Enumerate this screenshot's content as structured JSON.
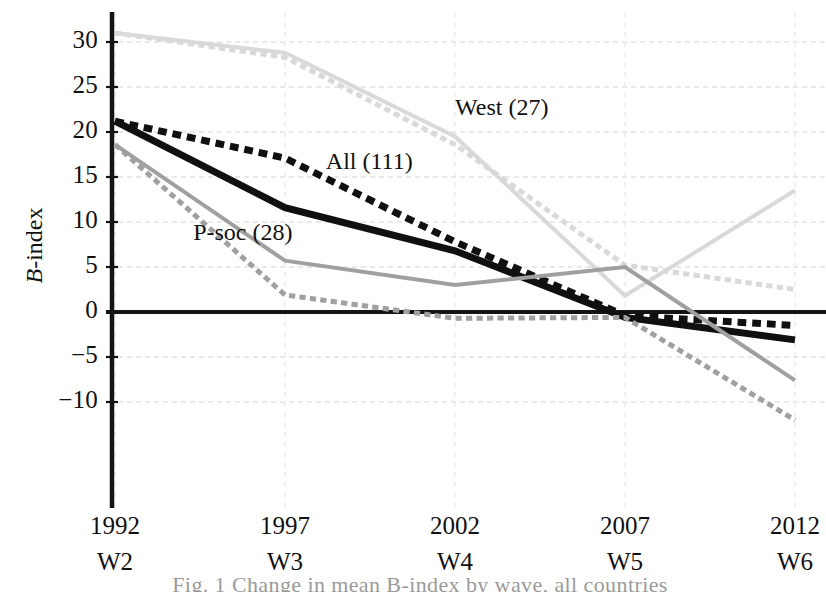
{
  "chart_data": {
    "type": "line",
    "title": "",
    "xlabel": "",
    "ylabel": "B-index",
    "ylabel_plain": "B-index",
    "xlim": [
      1992,
      2012
    ],
    "ylim": [
      -12,
      32
    ],
    "grid": true,
    "legend": "inline-annotations",
    "x": [
      1992,
      1997,
      2002,
      2007,
      2012
    ],
    "x_tick_labels": [
      "1992",
      "1997",
      "2002",
      "2007",
      "2012"
    ],
    "x_tick_sublabels": [
      "W2",
      "W3",
      "W4",
      "W5",
      "W6"
    ],
    "y_tick_labels": [
      "30",
      "25",
      "20",
      "15",
      "10",
      "5",
      "0",
      "−5",
      "−10"
    ],
    "y_ticks": [
      30,
      25,
      20,
      15,
      10,
      5,
      0,
      -5,
      -10
    ],
    "series": [
      {
        "name": "West (27)",
        "style": "solid",
        "color": "#d9d9d9",
        "width": 4,
        "values": [
          31.0,
          28.8,
          19.5,
          1.8,
          13.5
        ]
      },
      {
        "name": "West (27) dotted",
        "style": "dotted",
        "color": "#d9d9d9",
        "width": 5,
        "values": [
          31.0,
          28.3,
          18.6,
          5.2,
          2.5
        ]
      },
      {
        "name": "All (111)",
        "style": "dotted",
        "color": "#101010",
        "width": 7,
        "values": [
          21.2,
          17.1,
          7.8,
          -0.4,
          -1.5
        ]
      },
      {
        "name": "All (111) solid",
        "style": "solid",
        "color": "#101010",
        "width": 7,
        "values": [
          21.2,
          11.6,
          6.8,
          -0.6,
          -3.1
        ]
      },
      {
        "name": "P-soc (28)",
        "style": "solid",
        "color": "#a0a0a0",
        "width": 4,
        "values": [
          18.6,
          5.7,
          3.0,
          5.0,
          -7.6
        ]
      },
      {
        "name": "P-soc (28) dotted",
        "style": "dotted",
        "color": "#a0a0a0",
        "width": 5,
        "values": [
          18.6,
          1.9,
          -0.7,
          -0.6,
          -12.0
        ]
      }
    ],
    "annotations": [
      {
        "text": "West (27)",
        "x": 2002,
        "y": 22.5
      },
      {
        "text": "All (111)",
        "x": 1998.2,
        "y": 16.5
      },
      {
        "text": "P-soc (28)",
        "x": 1994.3,
        "y": 8.6
      }
    ]
  },
  "caption": "Fig. 1  Change in mean B-index by wave, all countries"
}
